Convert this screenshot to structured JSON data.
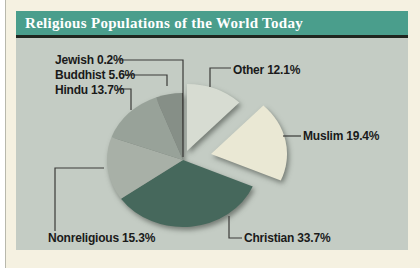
{
  "page": {
    "background": "#f5f1e1",
    "panel_background": "#c4ccc4"
  },
  "header": {
    "title": "Religious Populations of the World Today",
    "bar_color": "#4a9e8c",
    "rule_color": "#20261f",
    "text_color": "#ffffff"
  },
  "chart_data": {
    "type": "pie",
    "title": "Religious Populations of the World Today",
    "unit": "percent",
    "start_angle_deg": 0,
    "direction": "clockwise",
    "legend": "none (direct labels with leader lines)",
    "slices": [
      {
        "name": "Other",
        "value": 12.1,
        "label": "Other 12.1%",
        "color": "#d7dcd2",
        "exploded": true,
        "explode": [
          4,
          -9
        ]
      },
      {
        "name": "Muslim",
        "value": 19.4,
        "label": "Muslim 19.4%",
        "color": "#eae8d4",
        "exploded": true,
        "explode": [
          28,
          -6
        ]
      },
      {
        "name": "Christian",
        "value": 33.7,
        "label": "Christian 33.7%",
        "color": "#46685c",
        "exploded": false,
        "explode": [
          0,
          0
        ]
      },
      {
        "name": "Nonreligious",
        "value": 15.3,
        "label": "Nonreligious 15.3%",
        "color": "#a8b0a7",
        "exploded": false,
        "explode": [
          0,
          0
        ]
      },
      {
        "name": "Hindu",
        "value": 13.7,
        "label": "Hindu 13.7%",
        "color": "#98a299",
        "exploded": false,
        "explode": [
          0,
          0
        ]
      },
      {
        "name": "Buddhist",
        "value": 5.6,
        "label": "Buddhist 5.6%",
        "color": "#868f87",
        "exploded": false,
        "explode": [
          0,
          0
        ]
      },
      {
        "name": "Jewish",
        "value": 0.2,
        "label": "Jewish 0.2%",
        "color": "#55564f",
        "exploded": false,
        "explode": [
          0,
          0
        ]
      }
    ]
  }
}
